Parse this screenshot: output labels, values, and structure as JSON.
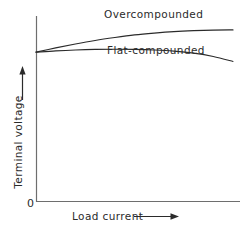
{
  "chart_data": {
    "type": "line",
    "title": "",
    "subtitle": "",
    "xlabel": "Load current",
    "ylabel": "Terminal voltage",
    "xlabel_arrow": "⟶",
    "ylabel_arrow": "↑",
    "origin_label": "0",
    "xlim": [
      0,
      1
    ],
    "ylim": [
      0,
      1
    ],
    "grid": false,
    "axis_ticks": false,
    "legend": "inline-annotations",
    "line_color": "#2b2b2b",
    "axis_color": "#6e6e6e",
    "background_color": "#ffffff",
    "series": [
      {
        "name": "Overcompounded",
        "label": "Overcompounded",
        "label_position": {
          "x": 104,
          "y": 8
        },
        "x": [
          0.0,
          0.1,
          0.2,
          0.3,
          0.4,
          0.5,
          0.6,
          0.7,
          0.8,
          0.9,
          1.0
        ],
        "y": [
          0.805,
          0.828,
          0.849,
          0.868,
          0.884,
          0.898,
          0.908,
          0.916,
          0.921,
          0.924,
          0.925
        ]
      },
      {
        "name": "Flat-compounded",
        "label": "Flat-compounded",
        "label_position": {
          "x": 107,
          "y": 44
        },
        "x": [
          0.0,
          0.1,
          0.2,
          0.3,
          0.4,
          0.5,
          0.6,
          0.7,
          0.8,
          0.9,
          1.0
        ],
        "y": [
          0.805,
          0.812,
          0.817,
          0.82,
          0.821,
          0.82,
          0.817,
          0.811,
          0.8,
          0.782,
          0.755
        ]
      }
    ]
  },
  "labels": {
    "overcompounded": "Overcompounded",
    "flat_compounded": "Flat-compounded",
    "x_axis": "Load current",
    "y_axis": "Terminal voltage",
    "origin": "0",
    "x_axis_arrow": "⟶"
  }
}
